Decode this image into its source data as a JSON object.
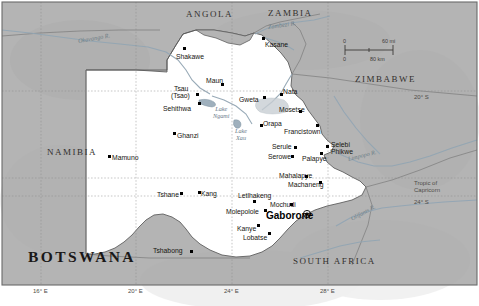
{
  "map": {
    "title": "BOTSWANA",
    "neighbors": [
      {
        "name": "ANGOLA",
        "x": 186,
        "y": 9,
        "size": "mid"
      },
      {
        "name": "ZAMBIA",
        "x": 268,
        "y": 8,
        "size": "mid"
      },
      {
        "name": "ZIMBABWE",
        "x": 355,
        "y": 74,
        "size": "mid"
      },
      {
        "name": "NAMIBIA",
        "x": 47,
        "y": 147,
        "size": "mid"
      },
      {
        "name": "SOUTH AFRICA",
        "x": 293,
        "y": 256,
        "size": "mid"
      }
    ],
    "capital": {
      "name": "Gaborone",
      "x": 266,
      "y": 212,
      "marker_x": 307,
      "marker_y": 214
    },
    "cities": [
      {
        "name": "Shakawe",
        "x": 176,
        "y": 53,
        "dot_x": 183,
        "dot_y": 47,
        "align": "left"
      },
      {
        "name": "Kasane",
        "x": 265,
        "y": 41,
        "dot_x": 262,
        "dot_y": 37,
        "align": "left"
      },
      {
        "name": "Maun",
        "x": 206,
        "y": 77,
        "dot_x": 221,
        "dot_y": 83,
        "align": "left"
      },
      {
        "name": "Tsau",
        "x": 174,
        "y": 85,
        "dot_x": 196,
        "dot_y": 93,
        "align": "left"
      },
      {
        "name": "(Tsao)",
        "x": 171,
        "y": 92,
        "align": "left"
      },
      {
        "name": "Sehithwa",
        "x": 163,
        "y": 105,
        "dot_x": 198,
        "dot_y": 102,
        "align": "left"
      },
      {
        "name": "Gweta",
        "x": 239,
        "y": 96,
        "dot_x": 263,
        "dot_y": 96,
        "align": "left"
      },
      {
        "name": "Nata",
        "x": 283,
        "y": 88,
        "dot_x": 280,
        "dot_y": 93,
        "align": "left"
      },
      {
        "name": "Mosetse",
        "x": 279,
        "y": 106,
        "dot_x": 299,
        "dot_y": 110,
        "align": "left"
      },
      {
        "name": "Orapa",
        "x": 263,
        "y": 120,
        "dot_x": 260,
        "dot_y": 124,
        "align": "left"
      },
      {
        "name": "Francistown",
        "x": 284,
        "y": 128,
        "dot_x": 316,
        "dot_y": 124,
        "align": "left"
      },
      {
        "name": "Ghanzi",
        "x": 177,
        "y": 132,
        "dot_x": 173,
        "dot_y": 132,
        "align": "left"
      },
      {
        "name": "Serule",
        "x": 272,
        "y": 143,
        "dot_x": 294,
        "dot_y": 146,
        "align": "left"
      },
      {
        "name": "Selebi",
        "x": 331,
        "y": 141,
        "dot_x": 326,
        "dot_y": 145,
        "align": "left"
      },
      {
        "name": "Phikwe",
        "x": 331,
        "y": 148,
        "align": "left"
      },
      {
        "name": "Serowe",
        "x": 268,
        "y": 153,
        "dot_x": 291,
        "dot_y": 155,
        "align": "left"
      },
      {
        "name": "Palapye",
        "x": 302,
        "y": 155,
        "dot_x": 320,
        "dot_y": 152,
        "align": "left"
      },
      {
        "name": "Mamuno",
        "x": 112,
        "y": 154,
        "dot_x": 108,
        "dot_y": 155,
        "align": "left"
      },
      {
        "name": "Mahalapye",
        "x": 279,
        "y": 172,
        "dot_x": 305,
        "dot_y": 175,
        "align": "left"
      },
      {
        "name": "Machaneng",
        "x": 288,
        "y": 181,
        "dot_x": 319,
        "dot_y": 181,
        "align": "left"
      },
      {
        "name": "Tshane",
        "x": 157,
        "y": 191,
        "dot_x": 180,
        "dot_y": 192,
        "align": "left"
      },
      {
        "name": "Kang",
        "x": 201,
        "y": 190,
        "dot_x": 198,
        "dot_y": 191,
        "align": "left"
      },
      {
        "name": "Letlhakeng",
        "x": 238,
        "y": 192,
        "dot_x": 253,
        "dot_y": 200,
        "align": "left"
      },
      {
        "name": "Mochudi",
        "x": 270,
        "y": 201,
        "dot_x": 290,
        "dot_y": 203,
        "align": "left"
      },
      {
        "name": "Molepolole",
        "x": 226,
        "y": 208,
        "dot_x": 264,
        "dot_y": 209,
        "align": "left"
      },
      {
        "name": "Kanye",
        "x": 237,
        "y": 225,
        "dot_x": 257,
        "dot_y": 224,
        "align": "left"
      },
      {
        "name": "Lobatse",
        "x": 243,
        "y": 234,
        "dot_x": 268,
        "dot_y": 232,
        "align": "left"
      },
      {
        "name": "Tshabong",
        "x": 153,
        "y": 247,
        "dot_x": 190,
        "dot_y": 250,
        "align": "left"
      }
    ],
    "water_labels": [
      {
        "name": "Okavango R.",
        "x": 78,
        "y": 37,
        "rotate": -10
      },
      {
        "name": "Zambezi R.",
        "x": 268,
        "y": 23,
        "rotate": -8
      },
      {
        "name": "Limpopo R.",
        "x": 348,
        "y": 155,
        "rotate": -14
      },
      {
        "name": "Olifants R.",
        "x": 351,
        "y": 215,
        "rotate": -28
      }
    ],
    "lakes": [
      {
        "name": "Lake",
        "name2": "Ngami",
        "x": 213,
        "y": 108
      },
      {
        "name": "Lake",
        "name2": "Xau",
        "x": 235,
        "y": 130
      }
    ],
    "graticule": {
      "longitudes": [
        {
          "label": "16° E",
          "x": 33,
          "y": 288
        },
        {
          "label": "20° E",
          "x": 128,
          "y": 288
        },
        {
          "label": "24° E",
          "x": 224,
          "y": 288
        },
        {
          "label": "28° E",
          "x": 320,
          "y": 288
        }
      ],
      "latitudes": [
        {
          "label": "20° S",
          "x": 414,
          "y": 97
        },
        {
          "label": "24° S",
          "x": 414,
          "y": 202
        }
      ],
      "tropic": {
        "line1": "Tropic of",
        "line2": "Capricorn",
        "x": 414,
        "y": 182
      }
    },
    "scalebar": {
      "mi_zero": "0",
      "mi_max": "60 mi",
      "km_zero": "0",
      "km_max": "80 km"
    },
    "colors": {
      "land_neighbor": "#b3b3b3",
      "land_botswana": "#ffffff",
      "water": "#9fb0bd",
      "border": "#6e6e6e",
      "text": "#16140f"
    }
  }
}
